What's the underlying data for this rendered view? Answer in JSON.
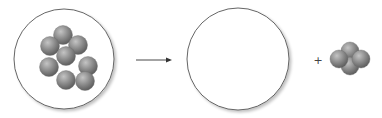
{
  "diagram": {
    "left_container": {
      "label": "",
      "particle_count": 8
    },
    "arrow": {
      "direction": "right"
    },
    "right_container": {
      "label": "",
      "particle_count": 0
    },
    "operator": "+",
    "product_cluster": {
      "particle_count": 4
    },
    "colors": {
      "particle": "#8a8a8a",
      "particle_highlight": "#c4c4c4",
      "particle_shadow": "#5c5c5c",
      "container_stroke": "#555555",
      "arrow": "#333333"
    }
  }
}
